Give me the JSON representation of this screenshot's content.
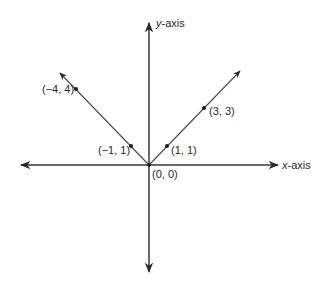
{
  "diagram": {
    "type": "coordinate-plane",
    "axes": {
      "x_label": "x-axis",
      "x_label_italic": "x",
      "x_label_rest": "-axis",
      "y_label": "y-axis",
      "y_label_italic": "y",
      "y_label_rest": "-axis"
    },
    "origin_label": "(0, 0)",
    "points": [
      {
        "label": "(−4, 4)",
        "x": -4,
        "y": 4
      },
      {
        "label": "(−1, 1)",
        "x": -1,
        "y": 1
      },
      {
        "label": "(1, 1)",
        "x": 1,
        "y": 1
      },
      {
        "label": "(3, 3)",
        "x": 3,
        "y": 3
      }
    ],
    "rays": [
      {
        "name": "left-ray",
        "direction": "up-left",
        "function": "y = -x, x ≤ 0"
      },
      {
        "name": "right-ray",
        "direction": "up-right",
        "function": "y = x, x ≥ 0"
      }
    ],
    "colors": {
      "line": "#3a3a3a",
      "text": "#2a2a2a",
      "background": "#ffffff"
    }
  }
}
